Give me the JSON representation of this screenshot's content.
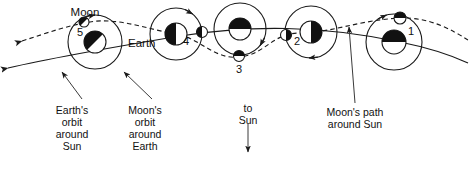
{
  "figure": {
    "type": "astronomy-diagram",
    "background_color": "#ffffff",
    "line_color": "#1a1a1a",
    "body_fill_dark": "#111111",
    "body_fill_light": "#ffffff"
  },
  "labels": {
    "moon": "Moon",
    "earth": "Earth",
    "to_sun": "to Sun",
    "earth_orbit": "Earth's\norbit\naround\nSun",
    "earth_orbit_lines": [
      "Earth's",
      "orbit",
      "around",
      "Sun"
    ],
    "moon_orbit_lines": [
      "Moon's",
      "orbit",
      "around",
      "Earth"
    ],
    "moon_path_lines": [
      "Moon's path",
      "around Sun"
    ],
    "to_sun_lines": [
      "to",
      "Sun"
    ]
  },
  "positions": [
    {
      "number": "5",
      "earth_cx": 95,
      "earth_cy": 42,
      "earth_r": 11,
      "orbit_r": 27,
      "moon_cx": 84,
      "moon_cy": 22,
      "moon_r": 5,
      "earth_shade": "upper-left",
      "moon_shade": "upper-left",
      "num_x": 80,
      "num_y": 36
    },
    {
      "number": "4",
      "earth_cx": 176,
      "earth_cy": 34,
      "earth_r": 11,
      "orbit_r": 26,
      "moon_cx": 202,
      "moon_cy": 32,
      "moon_r": 5.5,
      "earth_shade": "left",
      "moon_shade": "left",
      "num_x": 186,
      "num_y": 45
    },
    {
      "number": "3",
      "earth_cx": 240,
      "earth_cy": 29,
      "earth_r": 11,
      "orbit_r": 26,
      "moon_cx": 239,
      "moon_cy": 56,
      "moon_r": 5.5,
      "earth_shade": "upper",
      "moon_shade": "upper",
      "num_x": 239,
      "num_y": 73
    },
    {
      "number": "2",
      "earth_cx": 311,
      "earth_cy": 32,
      "earth_r": 11,
      "orbit_r": 26,
      "moon_cx": 286,
      "moon_cy": 35,
      "moon_r": 5.5,
      "earth_shade": "right",
      "moon_shade": "right",
      "num_x": 297,
      "num_y": 45
    },
    {
      "number": "1",
      "earth_cx": 394,
      "earth_cy": 42,
      "earth_r": 12,
      "orbit_r": 28,
      "moon_cx": 400,
      "moon_cy": 18,
      "moon_r": 6,
      "earth_shade": "upper",
      "moon_shade": "upper",
      "num_x": 411,
      "num_y": 35
    }
  ],
  "paths": {
    "earth_orbit_solid": "M 8,68 C 60,56 120,46 180,36 C 250,25 320,25 400,42 C 430,48 455,57 468,63",
    "moon_path_dashed": "M 22,41 C 50,32 66,26 90,22 C 118,17 150,30 176,34 C 200,38 214,60 240,57 C 266,54 272,33 300,33 C 330,33 360,20 400,18 C 430,17 452,30 468,40"
  },
  "annotations": {
    "earth_orbit_label_x": 72,
    "moon_orbit_label_x": 145,
    "to_sun_label_x": 248,
    "moon_path_label_x": 355
  }
}
